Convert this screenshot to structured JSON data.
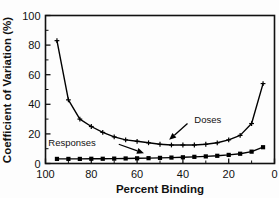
{
  "chart_data": {
    "type": "line",
    "title": "",
    "xlabel": "Percent Binding",
    "ylabel": "Coefficient of Variation (%)",
    "xlim": [
      100,
      0
    ],
    "ylim": [
      0,
      100
    ],
    "x_reversed": true,
    "grid": false,
    "legend_position": "inline-annotations",
    "xticks": [
      100,
      80,
      60,
      40,
      20,
      0
    ],
    "xtick_labels": [
      "100",
      "80",
      "60",
      "40",
      "20",
      "0"
    ],
    "x_minor_ticks": [
      90,
      70,
      50,
      30,
      10
    ],
    "yticks": [
      0,
      20,
      40,
      60,
      80,
      100
    ],
    "ytick_labels": [
      "0",
      "20",
      "40",
      "60",
      "80",
      "100"
    ],
    "y_minor_ticks": [
      10,
      30,
      50,
      70,
      90
    ],
    "x": [
      95,
      90,
      85,
      80,
      75,
      70,
      65,
      60,
      55,
      50,
      45,
      40,
      35,
      30,
      25,
      20,
      15,
      10,
      5
    ],
    "series": [
      {
        "name": "Doses",
        "marker": "plus",
        "values": [
          83,
          43,
          30,
          25,
          21,
          18,
          16,
          15,
          14,
          13,
          12.5,
          12.5,
          12.5,
          13,
          14,
          16,
          19,
          27,
          54
        ]
      },
      {
        "name": "Responses",
        "marker": "square",
        "values": [
          3.1,
          3.1,
          3.1,
          3.2,
          3.2,
          3.3,
          3.4,
          3.5,
          3.6,
          3.8,
          4.0,
          4.2,
          4.5,
          4.8,
          5.2,
          5.8,
          6.6,
          8.0,
          11.0
        ]
      }
    ],
    "annotations": [
      {
        "name": "Doses",
        "label": "Doses",
        "label_x": 35,
        "label_y": 30,
        "arrow_from_x": 38,
        "arrow_from_y": 27,
        "arrow_to_x": 46,
        "arrow_to_y": 16
      },
      {
        "name": "Responses",
        "label": "Responses",
        "label_x": 78,
        "label_y": 14,
        "arrow_from_x": 68,
        "arrow_from_y": 13,
        "arrow_to_x": 57,
        "arrow_to_y": 7
      }
    ]
  },
  "figure": {
    "background_color": "#fdfdfd",
    "line_color": "#000000",
    "text_color": "#111111"
  }
}
